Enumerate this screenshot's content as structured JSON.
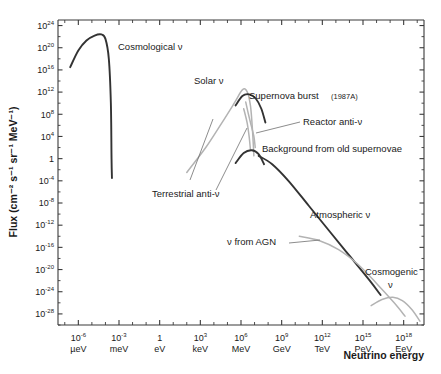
{
  "chart_data": {
    "type": "line",
    "title": "",
    "xlabel": "Neutrino energy",
    "ylabel": "Flux (cm⁻² s⁻¹ sr⁻¹ MeV⁻¹)",
    "xlim": [
      -7.5,
      19.5
    ],
    "ylim": [
      -30,
      25
    ],
    "grid": false,
    "legend": "none (in-plot annotations)",
    "x_tick_labels": [
      {
        "mantissa": "10",
        "exponent": "-6",
        "unit": "µeV",
        "log_x": -6
      },
      {
        "mantissa": "10",
        "exponent": "-3",
        "unit": "meV",
        "log_x": -3
      },
      {
        "mantissa": "1",
        "exponent": "",
        "unit": "eV",
        "log_x": 0
      },
      {
        "mantissa": "10",
        "exponent": "3",
        "unit": "keV",
        "log_x": 3
      },
      {
        "mantissa": "10",
        "exponent": "6",
        "unit": "MeV",
        "log_x": 6
      },
      {
        "mantissa": "10",
        "exponent": "9",
        "unit": "GeV",
        "log_x": 9
      },
      {
        "mantissa": "10",
        "exponent": "12",
        "unit": "TeV",
        "log_x": 12
      },
      {
        "mantissa": "10",
        "exponent": "15",
        "unit": "PeV",
        "log_x": 15
      },
      {
        "mantissa": "10",
        "exponent": "18",
        "unit": "EeV",
        "log_x": 18
      }
    ],
    "y_tick_labels": [
      {
        "mantissa": "10",
        "exponent": "24",
        "log_y": 24
      },
      {
        "mantissa": "10",
        "exponent": "20",
        "log_y": 20
      },
      {
        "mantissa": "10",
        "exponent": "16",
        "log_y": 16
      },
      {
        "mantissa": "10",
        "exponent": "12",
        "log_y": 12
      },
      {
        "mantissa": "10",
        "exponent": "8",
        "log_y": 8
      },
      {
        "mantissa": "10",
        "exponent": "4",
        "log_y": 4
      },
      {
        "mantissa": "1",
        "exponent": "",
        "log_y": 0
      },
      {
        "mantissa": "10",
        "exponent": "-4",
        "log_y": -4
      },
      {
        "mantissa": "10",
        "exponent": "-8",
        "log_y": -8
      },
      {
        "mantissa": "10",
        "exponent": "-12",
        "log_y": -12
      },
      {
        "mantissa": "10",
        "exponent": "-16",
        "log_y": -16
      },
      {
        "mantissa": "10",
        "exponent": "-20",
        "log_y": -20
      },
      {
        "mantissa": "10",
        "exponent": "-24",
        "log_y": -24
      },
      {
        "mantissa": "10",
        "exponent": "-28",
        "log_y": -28
      }
    ],
    "series": [
      {
        "name": "Cosmological ν",
        "color": "#4a4a4a",
        "label": "Cosmological ν",
        "points": [
          {
            "log_x": -6.6,
            "log_y": 16.5
          },
          {
            "log_x": -6.0,
            "log_y": 19.5
          },
          {
            "log_x": -5.4,
            "log_y": 21.3
          },
          {
            "log_x": -4.8,
            "log_y": 22.2
          },
          {
            "log_x": -4.3,
            "log_y": 22.4
          },
          {
            "log_x": -4.0,
            "log_y": 21.6
          },
          {
            "log_x": -3.75,
            "log_y": 18.0
          },
          {
            "log_x": -3.6,
            "log_y": 10.0
          },
          {
            "log_x": -3.55,
            "log_y": 0.0
          },
          {
            "log_x": -3.52,
            "log_y": -3.5
          }
        ]
      },
      {
        "name": "Solar ν",
        "color": "#b3b3b3",
        "label": "Solar ν",
        "points": [
          {
            "log_x": 2.0,
            "log_y": -2.5
          },
          {
            "log_x": 3.4,
            "log_y": 2.0
          },
          {
            "log_x": 4.6,
            "log_y": 6.5
          },
          {
            "log_x": 5.5,
            "log_y": 10.0
          },
          {
            "log_x": 6.1,
            "log_y": 12.4
          },
          {
            "log_x": 6.45,
            "log_y": 12.1
          },
          {
            "log_x": 6.7,
            "log_y": 9.5
          },
          {
            "log_x": 6.85,
            "log_y": 5.0
          },
          {
            "log_x": 6.95,
            "log_y": 0.5
          }
        ]
      },
      {
        "name": "Supernova burst (1987A)",
        "color": "#333333",
        "label": "Supernova burst",
        "label_suffix": "(1987A)",
        "points": [
          {
            "log_x": 5.6,
            "log_y": 9.6
          },
          {
            "log_x": 6.1,
            "log_y": 11.3
          },
          {
            "log_x": 6.6,
            "log_y": 11.6
          },
          {
            "log_x": 7.1,
            "log_y": 10.8
          },
          {
            "log_x": 7.5,
            "log_y": 9.0
          },
          {
            "log_x": 7.8,
            "log_y": 6.5
          }
        ]
      },
      {
        "name": "Reactor anti-ν",
        "color": "#9a9a9a",
        "label": "Reactor anti-ν",
        "points": [
          {
            "log_x": 6.35,
            "log_y": 10.2
          },
          {
            "log_x": 6.55,
            "log_y": 8.0
          },
          {
            "log_x": 6.75,
            "log_y": 6.0
          },
          {
            "log_x": 6.95,
            "log_y": 4.0
          },
          {
            "log_x": 7.05,
            "log_y": 2.0
          }
        ]
      },
      {
        "name": "Terrestrial anti-ν",
        "color": "#9a9a9a",
        "label": "Terrestrial anti-ν",
        "points": [
          {
            "log_x": 6.2,
            "log_y": 9.0
          },
          {
            "log_x": 6.45,
            "log_y": 6.5
          },
          {
            "log_x": 6.6,
            "log_y": 4.0
          },
          {
            "log_x": 6.7,
            "log_y": 1.5
          }
        ]
      },
      {
        "name": "Background from old supernovae",
        "color": "#333333",
        "label": "Background from old supernovae",
        "points": [
          {
            "log_x": 5.6,
            "log_y": -0.8
          },
          {
            "log_x": 6.2,
            "log_y": 1.0
          },
          {
            "log_x": 6.8,
            "log_y": 1.5
          },
          {
            "log_x": 7.3,
            "log_y": 0.8
          },
          {
            "log_x": 7.7,
            "log_y": -1.0
          }
        ]
      },
      {
        "name": "Atmospheric ν",
        "color": "#333333",
        "label": "Atmospheric ν",
        "points": [
          {
            "log_x": 7.3,
            "log_y": 0.5
          },
          {
            "log_x": 8.3,
            "log_y": -1.0
          },
          {
            "log_x": 9.5,
            "log_y": -4.0
          },
          {
            "log_x": 11.0,
            "log_y": -8.5
          },
          {
            "log_x": 12.5,
            "log_y": -13.0
          },
          {
            "log_x": 14.0,
            "log_y": -17.5
          },
          {
            "log_x": 15.5,
            "log_y": -22.0
          },
          {
            "log_x": 16.3,
            "log_y": -24.6
          }
        ]
      },
      {
        "name": "ν from AGN",
        "color": "#9a9a9a",
        "label": "ν from AGN",
        "points": [
          {
            "log_x": 10.3,
            "log_y": -14.0
          },
          {
            "log_x": 11.8,
            "log_y": -14.8
          },
          {
            "log_x": 13.2,
            "log_y": -16.4
          },
          {
            "log_x": 14.6,
            "log_y": -19.0
          },
          {
            "log_x": 16.0,
            "log_y": -22.5
          },
          {
            "log_x": 17.3,
            "log_y": -26.0
          },
          {
            "log_x": 18.1,
            "log_y": -28.4
          }
        ]
      },
      {
        "name": "Cosmogenic ν",
        "color": "#9a9a9a",
        "label": "Cosmogenic ν",
        "points": [
          {
            "log_x": 15.6,
            "log_y": -26.5
          },
          {
            "log_x": 16.4,
            "log_y": -25.4
          },
          {
            "log_x": 17.2,
            "log_y": -25.0
          },
          {
            "log_x": 17.9,
            "log_y": -25.6
          },
          {
            "log_x": 18.6,
            "log_y": -27.2
          },
          {
            "log_x": 19.2,
            "log_y": -29.3
          }
        ]
      }
    ],
    "annotations": [
      {
        "id": "cosmological",
        "text": "Cosmological ν",
        "x": 118,
        "y": 50
      },
      {
        "id": "solar",
        "text": "Solar ν",
        "x": 194,
        "y": 84
      },
      {
        "id": "supernova-burst",
        "text": "Supernova burst",
        "x": 249,
        "y": 99
      },
      {
        "id": "supernova-burst-year",
        "text": "(1987A)",
        "x": 331,
        "y": 99
      },
      {
        "id": "reactor",
        "text": "Reactor anti-ν",
        "x": 303,
        "y": 125
      },
      {
        "id": "background-old-supernovae",
        "text": "Background from old supernovae",
        "x": 262,
        "y": 152
      },
      {
        "id": "terrestrial",
        "text": "Terrestrial anti-ν",
        "x": 152,
        "y": 197
      },
      {
        "id": "atmospheric",
        "text": "Atmospheric ν",
        "x": 310,
        "y": 218
      },
      {
        "id": "agn",
        "text": "ν from AGN",
        "x": 227,
        "y": 245
      },
      {
        "id": "cosmogenic",
        "text": "Cosmogenic",
        "x": 365,
        "y": 275
      },
      {
        "id": "cosmogenic-nu",
        "text": "ν",
        "x": 388,
        "y": 288
      }
    ]
  },
  "axes": {
    "x_title": "Neutrino energy",
    "y_title": "Flux (cm⁻² s⁻¹ sr⁻¹ MeV⁻¹)"
  }
}
